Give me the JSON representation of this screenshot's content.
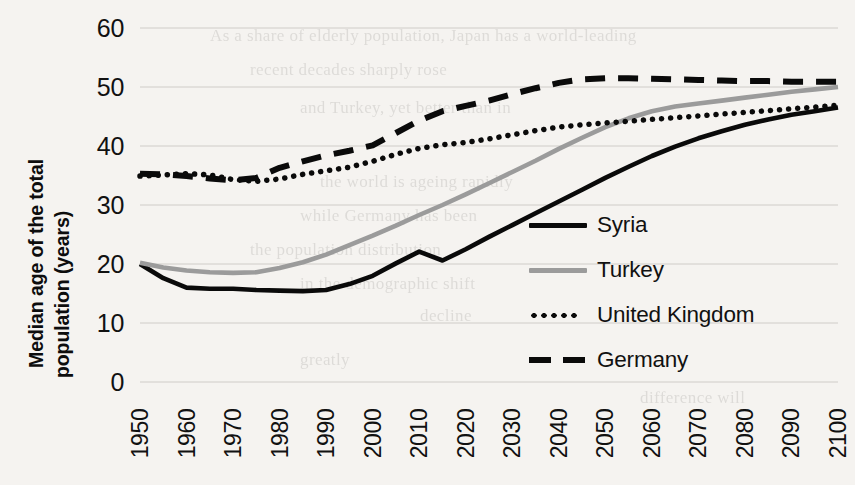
{
  "chart_data": {
    "type": "line",
    "title": "",
    "xlabel": "",
    "ylabel": "Median age of the total population (years)",
    "ylabel_lines": [
      "Median age of the total",
      "population (years)"
    ],
    "xlim": [
      1950,
      2100
    ],
    "ylim": [
      0,
      60
    ],
    "ytick_step": 10,
    "grid": true,
    "grid_axis": "y",
    "legend_position": "center-right inside plot",
    "x": [
      1950,
      1955,
      1960,
      1965,
      1970,
      1975,
      1980,
      1985,
      1990,
      1995,
      2000,
      2005,
      2010,
      2015,
      2020,
      2025,
      2030,
      2035,
      2040,
      2045,
      2050,
      2055,
      2060,
      2065,
      2070,
      2075,
      2080,
      2085,
      2090,
      2095,
      2100
    ],
    "xticks": [
      "1950",
      "1960",
      "1970",
      "1980",
      "1990",
      "2000",
      "2010",
      "2020",
      "2030",
      "2040",
      "2050",
      "2060",
      "2070",
      "2080",
      "2090",
      "2100"
    ],
    "yticks": [
      "0",
      "10",
      "20",
      "30",
      "40",
      "50",
      "60"
    ],
    "series": [
      {
        "name": "Syria",
        "color": "#0a0a0a",
        "style": "solid",
        "values": [
          20.0,
          17.6,
          16.0,
          15.8,
          15.8,
          15.6,
          15.5,
          15.4,
          15.6,
          16.6,
          18.0,
          20.1,
          22.1,
          20.6,
          22.5,
          24.6,
          26.6,
          28.6,
          30.6,
          32.6,
          34.6,
          36.5,
          38.3,
          39.9,
          41.3,
          42.5,
          43.6,
          44.5,
          45.3,
          45.9,
          46.5
        ]
      },
      {
        "name": "Turkey",
        "color": "#9b9b9b",
        "style": "solid",
        "values": [
          20.2,
          19.4,
          18.9,
          18.6,
          18.5,
          18.6,
          19.3,
          20.3,
          21.6,
          23.2,
          24.8,
          26.5,
          28.3,
          30.0,
          31.8,
          33.7,
          35.6,
          37.5,
          39.5,
          41.4,
          43.2,
          44.7,
          45.9,
          46.7,
          47.2,
          47.7,
          48.2,
          48.7,
          49.2,
          49.6,
          50.0
        ]
      },
      {
        "name": "United Kingdom",
        "color": "#0a0a0a",
        "style": "dotted",
        "values": [
          34.9,
          35.1,
          35.3,
          35.1,
          34.3,
          34.0,
          34.4,
          35.2,
          35.8,
          36.4,
          37.4,
          38.6,
          39.6,
          40.2,
          40.6,
          41.2,
          41.9,
          42.6,
          43.2,
          43.6,
          43.9,
          44.2,
          44.5,
          44.8,
          45.1,
          45.4,
          45.7,
          46.0,
          46.3,
          46.6,
          46.9
        ]
      },
      {
        "name": "Germany",
        "color": "#0a0a0a",
        "style": "dashed",
        "values": [
          35.3,
          35.2,
          34.9,
          34.5,
          34.2,
          34.6,
          36.3,
          37.4,
          38.4,
          39.2,
          40.1,
          42.2,
          44.3,
          45.9,
          46.8,
          47.7,
          48.8,
          49.8,
          50.7,
          51.3,
          51.5,
          51.5,
          51.4,
          51.3,
          51.2,
          51.1,
          51.0,
          51.0,
          50.9,
          50.9,
          50.9
        ]
      }
    ],
    "legend": [
      {
        "label": "Syria",
        "swatch": "solid-black"
      },
      {
        "label": "Turkey",
        "swatch": "solid-gray"
      },
      {
        "label": "United Kingdom",
        "swatch": "dotted-black"
      },
      {
        "label": "Germany",
        "swatch": "dashed-black"
      }
    ]
  },
  "scan_background_text": [
    {
      "text": "As a share of elderly population, Japan has a world-leading",
      "x": 210,
      "y": 26
    },
    {
      "text": "recent decades sharply rose",
      "x": 250,
      "y": 60
    },
    {
      "text": "and Turkey, yet better than in",
      "x": 300,
      "y": 98
    },
    {
      "text": "the world is ageing rapidly",
      "x": 320,
      "y": 172
    },
    {
      "text": "while Germany has been",
      "x": 300,
      "y": 206
    },
    {
      "text": "the population distribution",
      "x": 250,
      "y": 240
    },
    {
      "text": "in the demographic shift",
      "x": 300,
      "y": 274
    },
    {
      "text": "decline",
      "x": 420,
      "y": 306
    },
    {
      "text": "greatly",
      "x": 300,
      "y": 350
    },
    {
      "text": "difference will",
      "x": 640,
      "y": 388
    }
  ]
}
